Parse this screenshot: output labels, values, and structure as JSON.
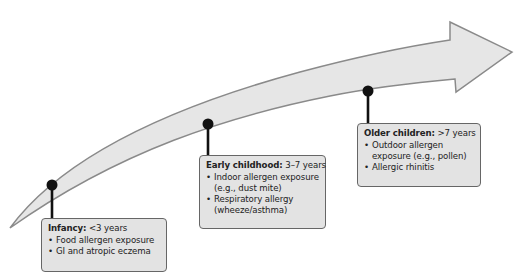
{
  "diagram": {
    "type": "timeline",
    "arrow": {
      "fill": "#e6e6e6",
      "stroke": "#8a8a8a"
    },
    "milestone_color": "#111111",
    "stages": [
      {
        "label": "Infancy:",
        "range": "<3 years",
        "items": [
          "Food allergen exposure",
          "GI and atropic eczema"
        ]
      },
      {
        "label": "Early childhood:",
        "range": "3–7 years",
        "items": [
          "Indoor allergen exposure (e.g., dust mite)",
          "Respiratory allergy (wheeze/asthma)"
        ]
      },
      {
        "label": "Older children:",
        "range": ">7 years",
        "items": [
          "Outdoor allergen exposure (e.g., pollen)",
          "Allergic rhinitis"
        ]
      }
    ]
  }
}
